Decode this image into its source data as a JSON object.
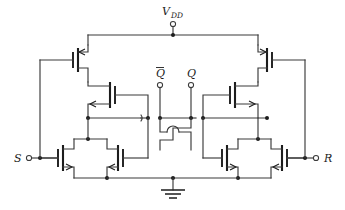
{
  "figure": {
    "type": "circuit-schematic",
    "width": 345,
    "height": 210,
    "background_color": "#ffffff",
    "wire_color": "#3a3a3a",
    "device_color": "#1c1c1c"
  },
  "labels": {
    "vdd": "V",
    "vdd_sub": "DD",
    "q_bar": "Q",
    "q": "Q",
    "set": "S",
    "reset": "R"
  },
  "terminals": [
    {
      "name": "vdd-terminal",
      "label": "V_DD",
      "x": 173,
      "y": 24
    },
    {
      "name": "qbar-terminal",
      "label": "Q-bar",
      "x": 160,
      "y": 85
    },
    {
      "name": "q-terminal",
      "label": "Q",
      "x": 191,
      "y": 85
    },
    {
      "name": "s-terminal",
      "label": "S",
      "x": 19,
      "y": 158
    },
    {
      "name": "r-terminal",
      "label": "R",
      "x": 326,
      "y": 158
    }
  ],
  "devices": [
    {
      "name": "pmos-top-left",
      "type": "PMOS",
      "x": 78,
      "y": 58
    },
    {
      "name": "pmos-top-right",
      "type": "PMOS",
      "x": 267,
      "y": 58
    },
    {
      "name": "pmos-mid-left",
      "type": "PMOS",
      "x": 110,
      "y": 95
    },
    {
      "name": "pmos-mid-right",
      "type": "PMOS",
      "x": 235,
      "y": 95
    },
    {
      "name": "nmos-left-outer",
      "type": "NMOS",
      "x": 63,
      "y": 158
    },
    {
      "name": "nmos-left-inner",
      "type": "NMOS",
      "x": 118,
      "y": 158
    },
    {
      "name": "nmos-right-inner",
      "type": "NMOS",
      "x": 227,
      "y": 158
    },
    {
      "name": "nmos-right-outer",
      "type": "NMOS",
      "x": 282,
      "y": 158
    }
  ],
  "ground": {
    "name": "ground-symbol",
    "x": 173,
    "y": 183
  },
  "crossings": [
    {
      "name": "wire-hop-left",
      "x": 148,
      "y": 118
    },
    {
      "name": "wire-hop-right",
      "x": 203,
      "y": 118
    },
    {
      "name": "wire-hop-cross",
      "x": 173,
      "y": 135
    }
  ]
}
